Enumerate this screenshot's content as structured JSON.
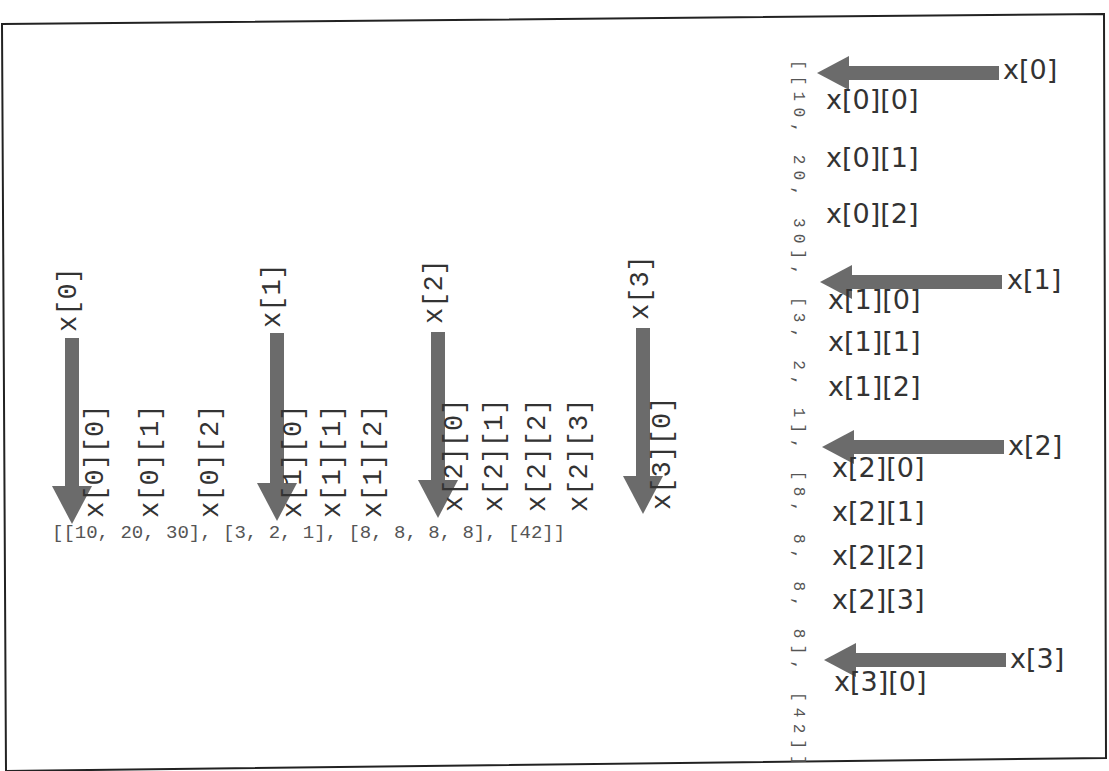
{
  "diagram": {
    "title": "",
    "list_literal": "[[10, 20, 30], [3, 2, 1], [8, 8, 8, 8], [42]]",
    "left_panel": {
      "groups": [
        {
          "outer_label": "x[0]",
          "items": [
            "x[0][0]",
            "x[0][1]",
            "x[0][2]"
          ]
        },
        {
          "outer_label": "x[1]",
          "items": [
            "x[1][0]",
            "x[1][1]",
            "x[1][2]"
          ]
        },
        {
          "outer_label": "x[2]",
          "items": [
            "x[2][0]",
            "x[2][1]",
            "x[2][2]",
            "x[2][3]"
          ]
        },
        {
          "outer_label": "x[3]",
          "items": [
            "x[3][0]"
          ]
        }
      ]
    },
    "right_panel": {
      "vertical_literal": "[[10, 20, 30], [3, 2, 1], [8, 8, 8, 8], [42]]",
      "groups": [
        {
          "outer_label": "x[0]",
          "items": [
            "x[0][0]",
            "x[0][1]",
            "x[0][2]"
          ]
        },
        {
          "outer_label": "x[1]",
          "items": [
            "x[1][0]",
            "x[1][1]",
            "x[1][2]"
          ]
        },
        {
          "outer_label": "x[2]",
          "items": [
            "x[2][0]",
            "x[2][1]",
            "x[2][2]",
            "x[2][3]"
          ]
        },
        {
          "outer_label": "x[3]",
          "items": [
            "x[3][0]"
          ]
        }
      ]
    },
    "colors": {
      "arrow": "#6b6b6b",
      "frame": "#222222",
      "text": "#333333",
      "literal": "#555555"
    }
  }
}
